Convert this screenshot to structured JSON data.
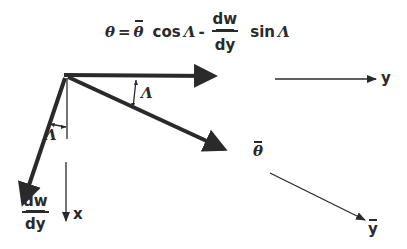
{
  "equation": {
    "lhs": "θ",
    "equals": "=",
    "theta_bar": "θ",
    "cos": "cos",
    "lambda1": "Λ",
    "minus": "-",
    "frac_num": "dw",
    "frac_den": "dy",
    "sin": "sin",
    "lambda2": "Λ"
  },
  "labels": {
    "y_axis": "y",
    "y_bar_axis": "y",
    "x_axis": "x",
    "theta_bar": "θ",
    "angle_top": "Λ",
    "angle_left": "Λ",
    "dw_num": "dw",
    "dw_den": "dy"
  },
  "colors": {
    "ink": "#2a2a2a",
    "background": "#ffffff"
  }
}
